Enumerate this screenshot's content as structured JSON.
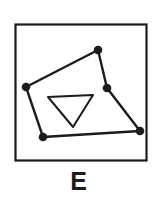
{
  "figure": {
    "label": "E",
    "label_name": "panel-letter-E",
    "background_color": "#ffffff",
    "ink_color": "#1c1c1c",
    "frame": {
      "name": "figure-border",
      "x": 15.5,
      "y": 24.5,
      "width": 131,
      "height": 136,
      "stroke_width": 2.2,
      "fill": "#ffffff"
    },
    "shapes": [
      {
        "name": "outer-pentagon",
        "type": "polygon",
        "closed": true,
        "stroke_width": 2.4,
        "fill": "none",
        "points": [
          {
            "name": "vertex-left",
            "x": 26,
            "y": 87
          },
          {
            "name": "vertex-top",
            "x": 98,
            "y": 50
          },
          {
            "name": "vertex-right-mid",
            "x": 107,
            "y": 88
          },
          {
            "name": "vertex-bottom-right",
            "x": 140,
            "y": 131
          },
          {
            "name": "vertex-bottom-left",
            "x": 43,
            "y": 137
          }
        ]
      },
      {
        "name": "inner-triangle",
        "type": "polygon",
        "closed": true,
        "stroke_width": 2.0,
        "fill": "none",
        "points": [
          {
            "name": "triangle-top-left",
            "x": 48,
            "y": 97
          },
          {
            "name": "triangle-top-right",
            "x": 93,
            "y": 95
          },
          {
            "name": "triangle-bottom-apex",
            "x": 73,
            "y": 127
          }
        ]
      }
    ],
    "vertex_markers": {
      "name": "vertex-dots",
      "radius": 4.3,
      "fill": "#1c1c1c",
      "count": 5
    }
  }
}
